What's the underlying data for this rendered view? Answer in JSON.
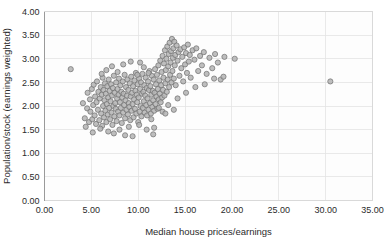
{
  "chart_data": {
    "type": "scatter",
    "title": "",
    "xlabel": "Median house prices/earnings",
    "ylabel": "Population/stock (earnings weighted)",
    "xlim": [
      0.0,
      35.0
    ],
    "ylim": [
      0.0,
      4.0
    ],
    "xticks": [
      "0.00",
      "5.00",
      "10.00",
      "15.00",
      "20.00",
      "25.00",
      "30.00",
      "35.00"
    ],
    "yticks": [
      "0.00",
      "0.50",
      "1.00",
      "1.50",
      "2.00",
      "2.50",
      "3.00",
      "3.50",
      "4.00"
    ],
    "xtick_values": [
      0,
      5,
      10,
      15,
      20,
      25,
      30,
      35
    ],
    "ytick_values": [
      0,
      0.5,
      1.0,
      1.5,
      2.0,
      2.5,
      3.0,
      3.5,
      4.0
    ],
    "grid": true,
    "legend": null,
    "marker": {
      "shape": "circle",
      "radius": 2.6,
      "fill": "#b3b3b3",
      "stroke": "#6e6e6e"
    },
    "series": [
      {
        "name": "local authorities",
        "points": [
          [
            2.8,
            2.78
          ],
          [
            4.1,
            2.06
          ],
          [
            4.3,
            1.74
          ],
          [
            4.55,
            1.95
          ],
          [
            4.6,
            2.28
          ],
          [
            4.75,
            1.66
          ],
          [
            4.85,
            2.14
          ],
          [
            4.9,
            1.88
          ],
          [
            5.05,
            2.36
          ],
          [
            5.1,
            1.72
          ],
          [
            5.2,
            2.02
          ],
          [
            5.25,
            2.45
          ],
          [
            5.35,
            1.8
          ],
          [
            5.4,
            2.2
          ],
          [
            5.5,
            1.62
          ],
          [
            5.55,
            2.08
          ],
          [
            5.6,
            2.52
          ],
          [
            5.7,
            1.92
          ],
          [
            5.75,
            2.3
          ],
          [
            5.85,
            1.7
          ],
          [
            5.9,
            2.16
          ],
          [
            6.0,
            2.4
          ],
          [
            6.05,
            1.84
          ],
          [
            6.1,
            2.24
          ],
          [
            6.15,
            1.58
          ],
          [
            6.2,
            2.6
          ],
          [
            6.25,
            2.0
          ],
          [
            6.3,
            2.34
          ],
          [
            6.35,
            1.76
          ],
          [
            6.4,
            2.12
          ],
          [
            6.45,
            2.48
          ],
          [
            6.5,
            1.9
          ],
          [
            6.55,
            2.26
          ],
          [
            6.6,
            1.66
          ],
          [
            6.65,
            2.04
          ],
          [
            6.7,
            2.42
          ],
          [
            6.75,
            1.82
          ],
          [
            6.8,
            2.18
          ],
          [
            6.85,
            2.56
          ],
          [
            6.9,
            1.96
          ],
          [
            6.95,
            2.32
          ],
          [
            7.0,
            1.72
          ],
          [
            7.05,
            2.1
          ],
          [
            7.1,
            2.46
          ],
          [
            7.15,
            1.86
          ],
          [
            7.2,
            2.22
          ],
          [
            7.25,
            1.6
          ],
          [
            7.3,
            2.38
          ],
          [
            7.35,
            2.0
          ],
          [
            7.4,
            2.64
          ],
          [
            7.45,
            1.78
          ],
          [
            7.5,
            2.28
          ],
          [
            7.55,
            2.06
          ],
          [
            7.6,
            1.94
          ],
          [
            7.65,
            2.5
          ],
          [
            7.7,
            1.68
          ],
          [
            7.75,
            2.16
          ],
          [
            7.8,
            2.36
          ],
          [
            7.85,
            1.88
          ],
          [
            7.9,
            2.24
          ],
          [
            7.95,
            2.58
          ],
          [
            8.0,
            1.8
          ],
          [
            8.05,
            2.08
          ],
          [
            8.1,
            2.44
          ],
          [
            8.15,
            1.96
          ],
          [
            8.2,
            2.3
          ],
          [
            8.25,
            1.64
          ],
          [
            8.3,
            2.18
          ],
          [
            8.35,
            2.52
          ],
          [
            8.4,
            1.86
          ],
          [
            8.45,
            2.26
          ],
          [
            8.5,
            2.02
          ],
          [
            8.55,
            2.66
          ],
          [
            8.6,
            1.74
          ],
          [
            8.65,
            2.12
          ],
          [
            8.7,
            2.4
          ],
          [
            8.75,
            1.92
          ],
          [
            8.8,
            2.22
          ],
          [
            8.85,
            2.56
          ],
          [
            8.9,
            1.82
          ],
          [
            8.95,
            2.34
          ],
          [
            9.0,
            2.06
          ],
          [
            9.05,
            1.98
          ],
          [
            9.1,
            2.48
          ],
          [
            9.15,
            1.7
          ],
          [
            9.2,
            2.2
          ],
          [
            9.25,
            2.62
          ],
          [
            9.3,
            1.9
          ],
          [
            9.35,
            2.28
          ],
          [
            9.4,
            2.04
          ],
          [
            9.45,
            2.42
          ],
          [
            9.5,
            1.76
          ],
          [
            9.55,
            2.14
          ],
          [
            9.6,
            2.54
          ],
          [
            9.65,
            1.94
          ],
          [
            9.7,
            2.32
          ],
          [
            9.75,
            2.7
          ],
          [
            9.8,
            1.84
          ],
          [
            9.85,
            2.24
          ],
          [
            9.9,
            2.08
          ],
          [
            9.95,
            2.46
          ],
          [
            10.0,
            1.66
          ],
          [
            10.05,
            2.18
          ],
          [
            10.1,
            2.58
          ],
          [
            10.15,
            1.88
          ],
          [
            10.2,
            2.36
          ],
          [
            10.25,
            2.0
          ],
          [
            10.3,
            2.5
          ],
          [
            10.35,
            1.78
          ],
          [
            10.4,
            2.26
          ],
          [
            10.45,
            2.68
          ],
          [
            10.5,
            1.96
          ],
          [
            10.55,
            2.3
          ],
          [
            10.6,
            2.1
          ],
          [
            10.65,
            2.44
          ],
          [
            10.7,
            1.86
          ],
          [
            10.75,
            2.22
          ],
          [
            10.8,
            2.6
          ],
          [
            10.85,
            2.02
          ],
          [
            10.9,
            2.38
          ],
          [
            10.95,
            1.8
          ],
          [
            11.0,
            2.16
          ],
          [
            11.05,
            2.52
          ],
          [
            11.1,
            1.92
          ],
          [
            11.15,
            2.34
          ],
          [
            11.2,
            2.74
          ],
          [
            11.25,
            2.06
          ],
          [
            11.3,
            2.42
          ],
          [
            11.35,
            1.84
          ],
          [
            11.4,
            2.24
          ],
          [
            11.45,
            2.64
          ],
          [
            11.5,
            1.98
          ],
          [
            11.55,
            2.32
          ],
          [
            11.6,
            2.12
          ],
          [
            11.65,
            2.56
          ],
          [
            11.7,
            1.9
          ],
          [
            11.75,
            2.28
          ],
          [
            11.8,
            2.78
          ],
          [
            11.85,
            2.04
          ],
          [
            11.9,
            2.46
          ],
          [
            11.95,
            2.2
          ],
          [
            12.0,
            2.66
          ],
          [
            12.05,
            1.94
          ],
          [
            12.1,
            2.36
          ],
          [
            12.15,
            2.86
          ],
          [
            12.2,
            2.14
          ],
          [
            12.25,
            2.54
          ],
          [
            12.3,
            2.26
          ],
          [
            12.35,
            2.96
          ],
          [
            12.4,
            2.08
          ],
          [
            12.45,
            2.44
          ],
          [
            12.5,
            2.72
          ],
          [
            12.55,
            2.18
          ],
          [
            12.6,
            3.06
          ],
          [
            12.65,
            2.34
          ],
          [
            12.7,
            2.6
          ],
          [
            12.75,
            2.9
          ],
          [
            12.8,
            2.22
          ],
          [
            12.85,
            3.18
          ],
          [
            12.9,
            2.48
          ],
          [
            12.95,
            2.76
          ],
          [
            13.0,
            3.0
          ],
          [
            13.05,
            2.3
          ],
          [
            13.1,
            3.26
          ],
          [
            13.15,
            2.56
          ],
          [
            13.2,
            2.84
          ],
          [
            13.25,
            3.1
          ],
          [
            13.3,
            2.4
          ],
          [
            13.35,
            3.34
          ],
          [
            13.4,
            2.66
          ],
          [
            13.45,
            2.92
          ],
          [
            13.5,
            3.16
          ],
          [
            13.55,
            2.5
          ],
          [
            13.6,
            3.42
          ],
          [
            13.65,
            2.74
          ],
          [
            13.7,
            3.02
          ],
          [
            13.75,
            3.22
          ],
          [
            13.8,
            2.58
          ],
          [
            13.85,
            3.36
          ],
          [
            13.9,
            2.86
          ],
          [
            13.95,
            3.08
          ],
          [
            14.0,
            2.44
          ],
          [
            14.1,
            3.28
          ],
          [
            14.2,
            2.96
          ],
          [
            14.3,
            3.14
          ],
          [
            14.4,
            2.64
          ],
          [
            14.5,
            3.2
          ],
          [
            14.6,
            2.8
          ],
          [
            14.7,
            3.04
          ],
          [
            14.8,
            2.52
          ],
          [
            14.9,
            3.24
          ],
          [
            15.0,
            2.88
          ],
          [
            15.1,
            3.12
          ],
          [
            15.2,
            2.7
          ],
          [
            15.3,
            3.3
          ],
          [
            15.4,
            2.94
          ],
          [
            15.5,
            3.08
          ],
          [
            15.6,
            2.6
          ],
          [
            15.8,
            3.18
          ],
          [
            16.0,
            2.98
          ],
          [
            16.2,
            3.22
          ],
          [
            16.4,
            2.74
          ],
          [
            16.6,
            3.06
          ],
          [
            16.8,
            2.86
          ],
          [
            17.0,
            3.14
          ],
          [
            17.3,
            2.68
          ],
          [
            17.6,
            3.02
          ],
          [
            17.9,
            2.8
          ],
          [
            18.2,
            3.1
          ],
          [
            18.5,
            2.92
          ],
          [
            18.8,
            2.56
          ],
          [
            19.2,
            3.04
          ],
          [
            20.3,
            3.0
          ],
          [
            30.5,
            2.52
          ],
          [
            5.95,
            1.52
          ],
          [
            6.8,
            1.46
          ],
          [
            7.4,
            1.42
          ],
          [
            8.6,
            1.38
          ],
          [
            9.4,
            1.36
          ],
          [
            11.6,
            1.4
          ],
          [
            11.7,
            1.54
          ],
          [
            10.9,
            1.5
          ],
          [
            4.4,
            1.56
          ],
          [
            5.15,
            1.44
          ],
          [
            12.2,
            1.96
          ],
          [
            12.6,
            1.88
          ],
          [
            13.2,
            2.02
          ],
          [
            14.2,
            2.16
          ],
          [
            15.1,
            2.28
          ],
          [
            16.1,
            2.4
          ],
          [
            17.1,
            2.46
          ],
          [
            18.1,
            2.58
          ],
          [
            19.1,
            2.62
          ],
          [
            13.8,
            1.92
          ],
          [
            12.9,
            1.84
          ],
          [
            11.4,
            1.72
          ],
          [
            10.1,
            1.6
          ],
          [
            9.0,
            1.56
          ],
          [
            8.0,
            1.5
          ],
          [
            7.2,
            2.84
          ],
          [
            7.8,
            2.72
          ],
          [
            8.4,
            2.88
          ],
          [
            9.2,
            2.94
          ],
          [
            9.9,
            2.66
          ],
          [
            10.6,
            2.82
          ],
          [
            10.2,
            2.92
          ],
          [
            11.1,
            2.7
          ],
          [
            6.6,
            2.76
          ],
          [
            6.1,
            2.68
          ]
        ]
      }
    ]
  },
  "axes": {
    "x_title": "Median house prices/earnings",
    "y_title": "Population/stock (earnings weighted)"
  }
}
